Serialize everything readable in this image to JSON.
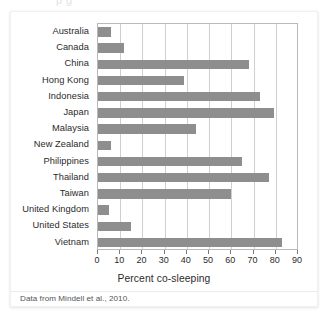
{
  "figure": {
    "top_fragment": "p g",
    "source_note": "Data from Mindell et al., 2010."
  },
  "chart_data": {
    "type": "bar",
    "orientation": "horizontal",
    "title": "",
    "subtitle": "",
    "xlabel": "Percent co-sleeping",
    "ylabel": "",
    "xlim": [
      0,
      90
    ],
    "xticks": [
      0,
      10,
      20,
      30,
      40,
      50,
      60,
      70,
      80,
      90
    ],
    "xtick_labels": [
      "0",
      "10",
      "20",
      "30",
      "40",
      "50",
      "60",
      "70",
      "80",
      "90"
    ],
    "grid": "vertical",
    "legend": null,
    "bar_color": "#8e8e8e",
    "categories": [
      "Australia",
      "Canada",
      "China",
      "Hong Kong",
      "Indonesia",
      "Japan",
      "Malaysia",
      "New Zealand",
      "Philippines",
      "Thailand",
      "Taiwan",
      "United Kingdom",
      "United  States",
      "Vietnam"
    ],
    "values": [
      6,
      11.5,
      68,
      38.5,
      73,
      79,
      44,
      6,
      65,
      77,
      60,
      5,
      15,
      83
    ],
    "series": [
      {
        "name": "Percent co-sleeping",
        "values": [
          6,
          11.5,
          68,
          38.5,
          73,
          79,
          44,
          6,
          65,
          77,
          60,
          5,
          15,
          83
        ]
      }
    ]
  }
}
